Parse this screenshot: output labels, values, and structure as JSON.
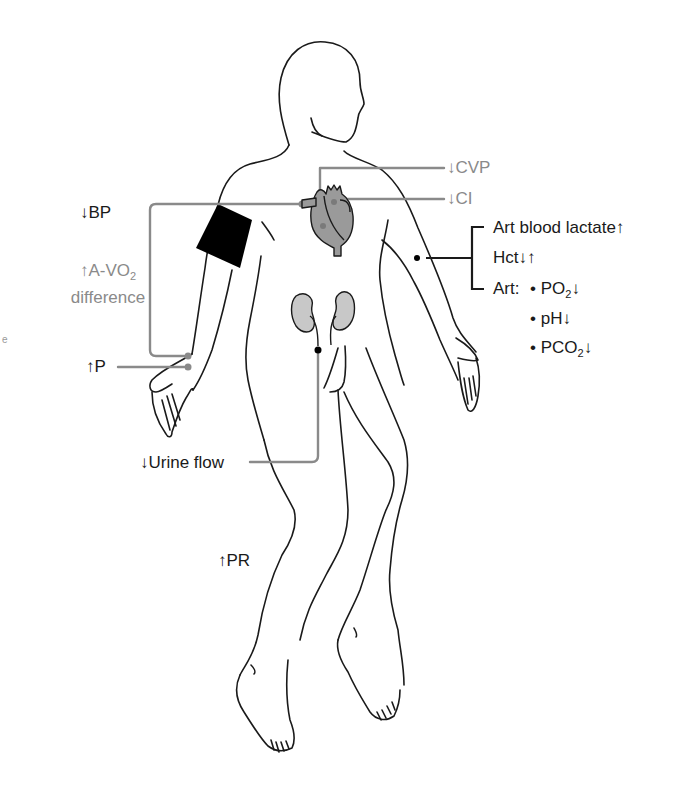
{
  "figure": {
    "colors": {
      "outline": "#1a1a1a",
      "gray_label": "#8a8a8a",
      "leader_gray": "#8a8a8a",
      "heart_fill": "#9a9a9a",
      "kidney_fill": "#c8c8c8",
      "cuff_fill": "#000000"
    }
  },
  "labels": {
    "bp": "↓BP",
    "avo2_line1_prefix": "↑A-VO",
    "avo2_line1_sub": "2",
    "avo2_line2": "difference",
    "p": "↑P",
    "cvp": "↓CVP",
    "ci": "↓CI",
    "urine_flow": "↓Urine flow",
    "pr": "↑PR",
    "left_edge_fragment": "e"
  },
  "blood_panel": {
    "lactate": "Art blood lactate↑",
    "hct": "Hct↓↑",
    "art_prefix": "Art:",
    "items": [
      {
        "bullet": "•",
        "main": "PO",
        "sub": "2",
        "arrow": "↓"
      },
      {
        "bullet": "•",
        "main": "pH",
        "sub": "",
        "arrow": "↓"
      },
      {
        "bullet": "•",
        "main": "PCO",
        "sub": "2",
        "arrow": "↓"
      }
    ]
  }
}
